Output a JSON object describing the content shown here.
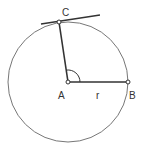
{
  "diagram": {
    "type": "circle-tangent",
    "circle": {
      "cx": 68,
      "cy": 82,
      "r": 60,
      "stroke": "#666666"
    },
    "points": {
      "A": {
        "label": "A",
        "x": 68,
        "y": 82
      },
      "B": {
        "label": "B",
        "x": 128,
        "y": 82
      },
      "C": {
        "label": "C",
        "x": 59,
        "y": 22
      }
    },
    "radius_label": "r",
    "segments": [
      {
        "from": "A",
        "to": "B"
      },
      {
        "from": "A",
        "to": "C"
      }
    ],
    "tangent_at": "C",
    "angle_mark": {
      "vertex": "A",
      "between": [
        "B",
        "C"
      ],
      "type": "arc"
    },
    "colors": {
      "line": "#333333",
      "circle": "#777777",
      "point_fill": "#ffffff"
    }
  }
}
